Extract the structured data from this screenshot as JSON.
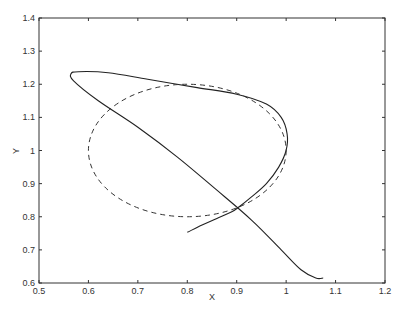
{
  "chart_data": {
    "type": "line",
    "title": "",
    "xlabel": "X",
    "ylabel": "Y",
    "xlim": [
      0.5,
      1.2
    ],
    "ylim": [
      0.6,
      1.4
    ],
    "grid": false,
    "legend": null,
    "xticks": [
      "0.5",
      "0.6",
      "0.7",
      "0.8",
      "0.9",
      "1",
      "1.1",
      "1.2"
    ],
    "yticks": [
      "0.6",
      "0.7",
      "0.8",
      "0.9",
      "1",
      "1.1",
      "1.2",
      "1.3",
      "1.4"
    ],
    "series": [
      {
        "name": "trajectory",
        "style": "solid",
        "color": "#222222",
        "x": [
          0.8,
          0.83,
          0.86,
          0.89,
          0.905,
          0.93,
          0.96,
          0.985,
          1.0,
          1.002,
          0.99,
          0.96,
          0.9,
          0.82,
          0.72,
          0.64,
          0.58,
          0.565,
          0.57,
          0.62,
          0.7,
          0.78,
          0.86,
          0.93,
          0.99,
          1.03,
          1.06,
          1.075
        ],
        "y": [
          0.753,
          0.775,
          0.795,
          0.815,
          0.83,
          0.86,
          0.9,
          0.95,
          1.0,
          1.05,
          1.1,
          1.14,
          1.17,
          1.19,
          1.215,
          1.235,
          1.238,
          1.232,
          1.21,
          1.15,
          1.07,
          0.98,
          0.88,
          0.79,
          0.7,
          0.64,
          0.615,
          0.615
        ]
      },
      {
        "name": "reference circle",
        "style": "dashed",
        "color": "#333333",
        "center": [
          0.8,
          1.0
        ],
        "radius": 0.2
      }
    ]
  }
}
